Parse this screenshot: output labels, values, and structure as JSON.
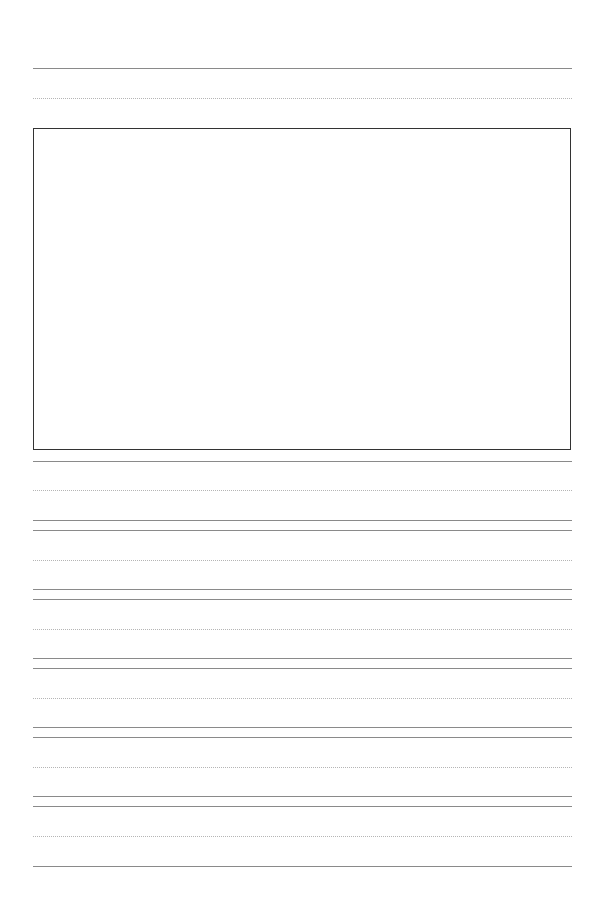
{
  "document": {
    "type": "handwriting-practice-paper",
    "width": 599,
    "height": 900,
    "colors": {
      "background": "#ffffff",
      "solid_line": "#8a8a8a",
      "dotted_line": "#b5b5b5",
      "box_border": "#333333"
    },
    "drawing_box": {
      "left": 33,
      "top": 128,
      "width": 536,
      "height": 320
    },
    "rules": [
      {
        "y": 68,
        "style": "solid"
      },
      {
        "y": 98,
        "style": "dotted"
      },
      {
        "y": 461,
        "style": "solid"
      },
      {
        "y": 490,
        "style": "dotted"
      },
      {
        "y": 520,
        "style": "solid"
      },
      {
        "y": 530,
        "style": "solid"
      },
      {
        "y": 560,
        "style": "dotted"
      },
      {
        "y": 589,
        "style": "solid"
      },
      {
        "y": 599,
        "style": "solid"
      },
      {
        "y": 629,
        "style": "dotted"
      },
      {
        "y": 658,
        "style": "solid"
      },
      {
        "y": 668,
        "style": "solid"
      },
      {
        "y": 698,
        "style": "dotted"
      },
      {
        "y": 727,
        "style": "solid"
      },
      {
        "y": 737,
        "style": "solid"
      },
      {
        "y": 767,
        "style": "dotted"
      },
      {
        "y": 796,
        "style": "solid"
      },
      {
        "y": 806,
        "style": "solid"
      },
      {
        "y": 836,
        "style": "dotted"
      },
      {
        "y": 866,
        "style": "solid"
      }
    ]
  }
}
